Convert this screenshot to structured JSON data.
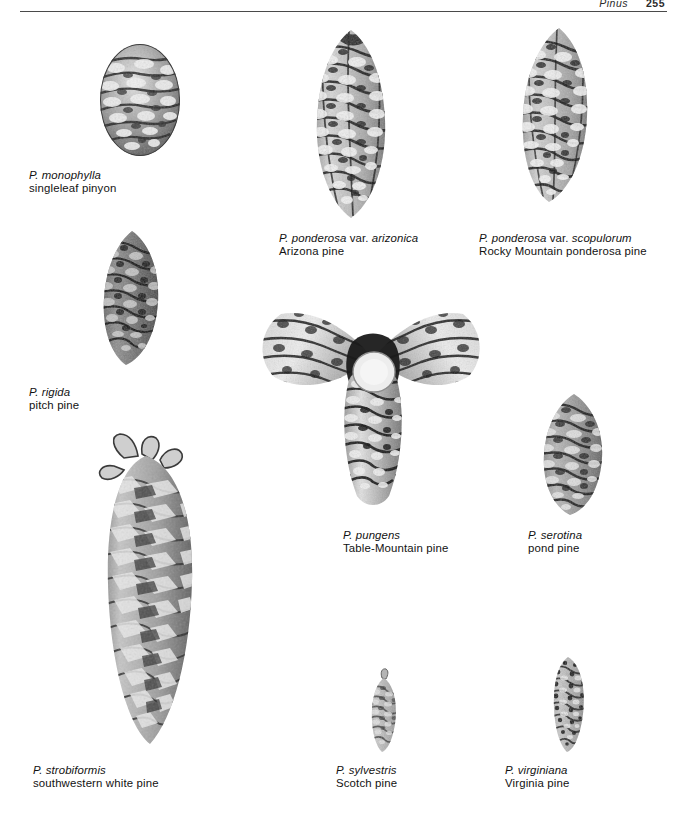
{
  "page": {
    "running_head_genus": "Pinus",
    "folio": "255",
    "background_color": "#ffffff",
    "ink_color": "#111111"
  },
  "figures": [
    {
      "id": "monophylla",
      "scientific_html": "P. monophylla",
      "scientific_plain": "P. monophylla",
      "common": "singleleaf pinyon",
      "cone_shape": "globose-ovoid",
      "image_name": "cone-photo-monophylla"
    },
    {
      "id": "ponderosa-arizonica",
      "scientific_html": "P. ponderosa <span class=\"roman\">var.</span> arizonica",
      "scientific_plain": "P. ponderosa var. arizonica",
      "common": "Arizona pine",
      "cone_shape": "ovoid-conic",
      "image_name": "cone-photo-ponderosa-arizonica"
    },
    {
      "id": "ponderosa-scopulorum",
      "scientific_html": "P. ponderosa <span class=\"roman\">var.</span> scopulorum",
      "scientific_plain": "P. ponderosa var. scopulorum",
      "common": "Rocky Mountain ponderosa pine",
      "cone_shape": "ovoid-conic",
      "image_name": "cone-photo-ponderosa-scopulorum"
    },
    {
      "id": "rigida",
      "scientific_html": "P. rigida",
      "scientific_plain": "P. rigida",
      "common": "pitch pine",
      "cone_shape": "ovoid-conic dark",
      "image_name": "cone-photo-rigida"
    },
    {
      "id": "pungens",
      "scientific_html": "P. pungens",
      "scientific_plain": "P. pungens",
      "common": "Table-Mountain pine",
      "cone_shape": "whorled cluster of three spiny cones",
      "image_name": "cone-photo-pungens-cluster"
    },
    {
      "id": "serotina",
      "scientific_html": "P. serotina",
      "scientific_plain": "P. serotina",
      "common": "pond pine",
      "cone_shape": "ovoid",
      "image_name": "cone-photo-serotina"
    },
    {
      "id": "strobiformis",
      "scientific_html": "P. strobiformis",
      "scientific_plain": "P. strobiformis",
      "common": "southwestern white pine",
      "cone_shape": "long cylindric",
      "image_name": "cone-photo-strobiformis"
    },
    {
      "id": "sylvestris",
      "scientific_html": "P. sylvestris",
      "scientific_plain": "P. sylvestris",
      "common": "Scotch pine",
      "cone_shape": "small narrow conic",
      "image_name": "cone-photo-sylvestris"
    },
    {
      "id": "virginiana",
      "scientific_html": "P. virginiana",
      "scientific_plain": "P. virginiana",
      "common": "Virginia pine",
      "cone_shape": "small ovoid-conic",
      "image_name": "cone-photo-virginiana"
    }
  ]
}
